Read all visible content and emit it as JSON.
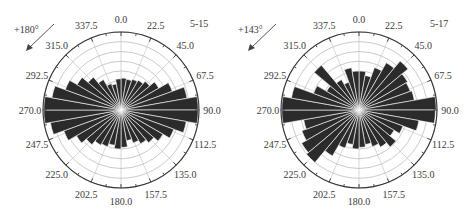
{
  "chart_data": [
    {
      "type": "rose",
      "panel_label": "5-15",
      "rotation_annotation": "+180°",
      "bin_width_deg": 10,
      "bins_start_deg": [
        0,
        10,
        20,
        30,
        40,
        50,
        60,
        70,
        80,
        90,
        100,
        110,
        120,
        130,
        140,
        150,
        160,
        170,
        180,
        190,
        200,
        210,
        220,
        230,
        240,
        250,
        260,
        270,
        280,
        290,
        300,
        310,
        320,
        330,
        340,
        350
      ],
      "values": [
        0.41,
        0.4,
        0.42,
        0.44,
        0.48,
        0.56,
        0.7,
        0.86,
        0.99,
        0.99,
        0.85,
        0.72,
        0.62,
        0.55,
        0.5,
        0.45,
        0.4,
        0.48,
        0.5,
        0.46,
        0.5,
        0.52,
        0.58,
        0.66,
        0.78,
        0.92,
        0.99,
        0.99,
        0.9,
        0.76,
        0.65,
        0.55,
        0.45,
        0.36,
        0.34,
        0.4
      ],
      "value_scale": "fraction of outer radius",
      "angle_tick_labels": [
        "0.0",
        "22.5",
        "45.0",
        "67.5",
        "90.0",
        "112.5",
        "135.0",
        "157.5",
        "180.0",
        "202.5",
        "225.0",
        "247.5",
        "270.0",
        "292.5",
        "315.0",
        "337.5"
      ],
      "rings": 8,
      "grid": true
    },
    {
      "type": "rose",
      "panel_label": "5-17",
      "rotation_annotation": "+143°",
      "bin_width_deg": 10,
      "bins_start_deg": [
        0,
        10,
        20,
        30,
        40,
        50,
        60,
        70,
        80,
        90,
        100,
        110,
        120,
        130,
        140,
        150,
        160,
        170,
        180,
        190,
        200,
        210,
        220,
        230,
        240,
        250,
        260,
        270,
        280,
        290,
        300,
        310,
        320,
        330,
        340,
        350
      ],
      "values": [
        0.5,
        0.45,
        0.58,
        0.7,
        0.82,
        0.72,
        0.7,
        0.72,
        0.99,
        0.98,
        0.78,
        0.6,
        0.52,
        0.62,
        0.55,
        0.5,
        0.45,
        0.48,
        0.5,
        0.45,
        0.52,
        0.68,
        0.88,
        0.85,
        0.78,
        0.72,
        0.99,
        0.99,
        0.88,
        0.62,
        0.48,
        0.75,
        0.45,
        0.38,
        0.55,
        0.5
      ],
      "value_scale": "fraction of outer radius",
      "angle_tick_labels": [
        "0.0",
        "22.5",
        "45.0",
        "67.5",
        "90.0",
        "112.5",
        "135.0",
        "157.5",
        "180.0",
        "202.5",
        "225.0",
        "247.5",
        "270.0",
        "292.5",
        "315.0",
        "337.5"
      ],
      "rings": 8,
      "grid": true
    }
  ],
  "colors": {
    "bar_fill": "#2b2b2b",
    "bar_separator": "#ffffff",
    "grid": "#bdbdbd",
    "outer_circle": "#333333",
    "text": "#3a3a3a"
  }
}
